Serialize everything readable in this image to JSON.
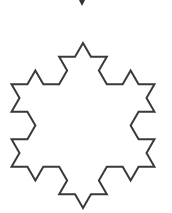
{
  "figure": {
    "type": "koch-snowflake",
    "iteration": 2,
    "center": [
      83,
      125.5
    ],
    "radius": 82.5,
    "stroke_color": "#3a3a3a",
    "stroke_width": 2,
    "fill": "#ffffff",
    "background": "#ffffff"
  },
  "marker": {
    "shape": "small-down-triangle",
    "position": [
      82,
      3
    ],
    "color": "#333333"
  }
}
